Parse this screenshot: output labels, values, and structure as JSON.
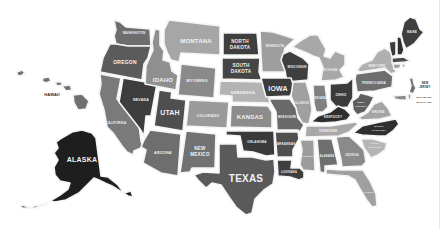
{
  "map": {
    "title": "United States",
    "colors": {
      "background": "#ffffff",
      "darkest": "#2b2b2b",
      "dark": "#4d4d4d",
      "mid_dark": "#6a6a6a",
      "mid": "#858585",
      "light": "#a3a3a3",
      "lightest": "#bdbdbd"
    },
    "states": [
      {
        "id": "WA",
        "label": "WASHINGTON",
        "fill": "#6e6e6e"
      },
      {
        "id": "OR",
        "label": "OREGON",
        "fill": "#5c5c5c"
      },
      {
        "id": "CA",
        "label": "CALIFORNIA",
        "fill": "#7a7a7a"
      },
      {
        "id": "NV",
        "label": "NEVADA",
        "fill": "#3d3d3d"
      },
      {
        "id": "ID",
        "label": "IDAHO",
        "fill": "#8f8f8f"
      },
      {
        "id": "MT",
        "label": "MONTANA",
        "fill": "#a6a6a6"
      },
      {
        "id": "WY",
        "label": "WYOMING",
        "fill": "#8a8a8a"
      },
      {
        "id": "UT",
        "label": "UTAH",
        "fill": "#4f4f4f"
      },
      {
        "id": "AZ",
        "label": "ARIZONA",
        "fill": "#6e6e6e"
      },
      {
        "id": "CO",
        "label": "COLORADO",
        "fill": "#9a9a9a"
      },
      {
        "id": "NM",
        "label": "NEW MEXICO",
        "fill": "#727272"
      },
      {
        "id": "ND",
        "label": "NORTH DAKOTA",
        "fill": "#3f3f3f"
      },
      {
        "id": "SD",
        "label": "SOUTH DAKOTA",
        "fill": "#454545"
      },
      {
        "id": "NE",
        "label": "NEBRASKA",
        "fill": "#b3b3b3"
      },
      {
        "id": "KS",
        "label": "KANSAS",
        "fill": "#8c8c8c"
      },
      {
        "id": "OK",
        "label": "OKLAHOMA",
        "fill": "#3a3a3a"
      },
      {
        "id": "TX",
        "label": "TEXAS",
        "fill": "#5a5a5a"
      },
      {
        "id": "MN",
        "label": "MINNESOTA",
        "fill": "#9e9e9e"
      },
      {
        "id": "IA",
        "label": "IOWA",
        "fill": "#3c3c3c"
      },
      {
        "id": "MO",
        "label": "MISSOURI",
        "fill": "#6a6a6a"
      },
      {
        "id": "AR",
        "label": "ARKANSAS",
        "fill": "#4f4f4f"
      },
      {
        "id": "LA",
        "label": "LOUISIANA",
        "fill": "#3e3e3e"
      },
      {
        "id": "WI",
        "label": "WISCONSIN",
        "fill": "#3f3f3f"
      },
      {
        "id": "IL",
        "label": "ILLINOIS",
        "fill": "#a0a0a0"
      },
      {
        "id": "MI",
        "label": "MICHIGAN",
        "fill": "#a8a8a8"
      },
      {
        "id": "IN",
        "label": "INDIANA",
        "fill": "#808080"
      },
      {
        "id": "OH",
        "label": "OHIO",
        "fill": "#3b3b3b"
      },
      {
        "id": "KY",
        "label": "KENTUCKY",
        "fill": "#2e2e2e"
      },
      {
        "id": "TN",
        "label": "TENNESSEE",
        "fill": "#a8a8a8"
      },
      {
        "id": "MS",
        "label": "MISSISSIPPI",
        "fill": "#9c9c9c"
      },
      {
        "id": "AL",
        "label": "ALABAMA",
        "fill": "#6e6e6e"
      },
      {
        "id": "GA",
        "label": "GEORGIA",
        "fill": "#8a8a8a"
      },
      {
        "id": "FL",
        "label": "FLORIDA",
        "fill": "#a0a0a0"
      },
      {
        "id": "SC",
        "label": "SOUTH CAROLINA",
        "fill": "#b5b5b5"
      },
      {
        "id": "NC",
        "label": "NORTH CAROLINA",
        "fill": "#2f2f2f"
      },
      {
        "id": "VA",
        "label": "VIRGINIA",
        "fill": "#a5a5a5"
      },
      {
        "id": "WV",
        "label": "WEST VIRGINIA",
        "fill": "#5e5e5e"
      },
      {
        "id": "PA",
        "label": "PENNSYLVANIA",
        "fill": "#6e6e6e"
      },
      {
        "id": "NY",
        "label": "NEW YORK",
        "fill": "#b0b0b0"
      },
      {
        "id": "VT",
        "label": "VERMONT",
        "fill": "#3a3a3a"
      },
      {
        "id": "NH",
        "label": "NEW HAMPSHIRE",
        "fill": "#2e2e2e"
      },
      {
        "id": "ME",
        "label": "MAINE",
        "fill": "#3f3f3f"
      },
      {
        "id": "MA",
        "label": "MASSACHUSETTS",
        "fill": "#4a4a4a"
      },
      {
        "id": "CT",
        "label": "CONNECTICUT",
        "fill": "#9a9a9a"
      },
      {
        "id": "RI",
        "label": "RHODE ISLAND",
        "fill": "#8a8a8a"
      },
      {
        "id": "NJ",
        "label": "NEW JERSEY",
        "fill": "#707070"
      },
      {
        "id": "DE",
        "label": "DELAWARE",
        "fill": "#9a9a9a"
      },
      {
        "id": "MD",
        "label": "MARYLAND",
        "fill": "#8a8a8a"
      },
      {
        "id": "AK",
        "label": "ALASKA",
        "fill": "#1f1f1f"
      },
      {
        "id": "HI",
        "label": "HAWAII",
        "fill": "#6a6a6a"
      }
    ],
    "external_labels": {
      "HI": "HAWAII",
      "NJ_line1": "NEW",
      "NJ_line2": "JERSEY",
      "DE": "DELAWARE",
      "MD": "MARYLAND"
    },
    "labels": {
      "WA": "WASHINGTON",
      "OR": "OREGON",
      "CA": "CALIFORNIA",
      "NV": "NEVADA",
      "ID": "IDAHO",
      "MT": "MONTANA",
      "WY": "WYOMING",
      "UT": "UTAH",
      "AZ": "ARIZONA",
      "CO": "COLORADO",
      "NM_1": "NEW",
      "NM_2": "MEXICO",
      "ND_1": "NORTH",
      "ND_2": "DAKOTA",
      "SD_1": "SOUTH",
      "SD_2": "DAKOTA",
      "NE": "NEBRASKA",
      "KS": "KANSAS",
      "OK": "OKLAHOMA",
      "TX": "TEXAS",
      "MN": "MINNESOTA",
      "IA": "IOWA",
      "MO": "MISSOURI",
      "AR": "ARKANSAS",
      "LA": "LOUISIANA",
      "WI": "WISCONSIN",
      "IL": "ILLINOIS",
      "MI": "MICHIGAN",
      "IN": "INDIANA",
      "OH": "OHIO",
      "KY": "KENTUCKY",
      "TN": "TENNESSEE",
      "MS": "MISSISSIPPI",
      "AL": "ALABAMA",
      "GA": "GEORGIA",
      "FL": "FLORIDA",
      "SC_1": "SOUTH",
      "SC_2": "CAROLINA",
      "NC_1": "NORTH",
      "NC_2": "CAROLINA",
      "VA": "VIRGINIA",
      "WV_1": "WEST",
      "WV_2": "VIRGINIA",
      "PA": "PENNSYLVANIA",
      "NY": "NEW YORK",
      "ME": "MAINE",
      "AK": "ALASKA"
    }
  }
}
